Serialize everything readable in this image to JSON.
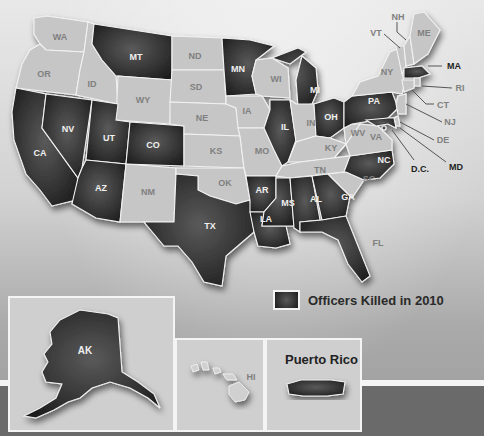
{
  "legend": {
    "label": "Officers Killed in 2010",
    "swatch_color": "#2a2a2a"
  },
  "colors": {
    "killed": "#2a2a2a",
    "not_killed": "#c6c6c6",
    "border": "#f2f2f2"
  },
  "states": {
    "WA": {
      "label": "WA",
      "killed": false
    },
    "OR": {
      "label": "OR",
      "killed": false
    },
    "CA": {
      "label": "CA",
      "killed": true
    },
    "ID": {
      "label": "ID",
      "killed": false
    },
    "NV": {
      "label": "NV",
      "killed": true
    },
    "MT": {
      "label": "MT",
      "killed": true
    },
    "WY": {
      "label": "WY",
      "killed": false
    },
    "UT": {
      "label": "UT",
      "killed": true
    },
    "AZ": {
      "label": "AZ",
      "killed": true
    },
    "CO": {
      "label": "CO",
      "killed": true
    },
    "NM": {
      "label": "NM",
      "killed": false
    },
    "ND": {
      "label": "ND",
      "killed": false
    },
    "SD": {
      "label": "SD",
      "killed": false
    },
    "NE": {
      "label": "NE",
      "killed": false
    },
    "KS": {
      "label": "KS",
      "killed": false
    },
    "OK": {
      "label": "OK",
      "killed": false
    },
    "TX": {
      "label": "TX",
      "killed": true
    },
    "MN": {
      "label": "MN",
      "killed": true
    },
    "IA": {
      "label": "IA",
      "killed": false
    },
    "MO": {
      "label": "MO",
      "killed": false
    },
    "AR": {
      "label": "AR",
      "killed": true
    },
    "LA": {
      "label": "LA",
      "killed": true
    },
    "WI": {
      "label": "WI",
      "killed": false
    },
    "IL": {
      "label": "IL",
      "killed": true
    },
    "MI": {
      "label": "MI",
      "killed": true
    },
    "IN": {
      "label": "IN",
      "killed": false
    },
    "OH": {
      "label": "OH",
      "killed": true
    },
    "KY": {
      "label": "KY",
      "killed": false
    },
    "TN": {
      "label": "TN",
      "killed": false
    },
    "MS": {
      "label": "MS",
      "killed": true
    },
    "AL": {
      "label": "AL",
      "killed": true
    },
    "GA": {
      "label": "GA",
      "killed": true
    },
    "FL": {
      "label": "FL",
      "killed": true
    },
    "SC": {
      "label": "SC",
      "killed": false
    },
    "NC": {
      "label": "NC",
      "killed": true
    },
    "VA": {
      "label": "VA",
      "killed": false
    },
    "WV": {
      "label": "WV",
      "killed": false
    },
    "PA": {
      "label": "PA",
      "killed": true
    },
    "NY": {
      "label": "NY",
      "killed": false
    },
    "VT": {
      "label": "VT",
      "killed": false
    },
    "NH": {
      "label": "NH",
      "killed": false
    },
    "ME": {
      "label": "ME",
      "killed": false
    },
    "MA": {
      "label": "MA",
      "killed": true
    },
    "RI": {
      "label": "RI",
      "killed": false
    },
    "CT": {
      "label": "CT",
      "killed": false
    },
    "NJ": {
      "label": "NJ",
      "killed": false
    },
    "DE": {
      "label": "DE",
      "killed": false
    },
    "MD": {
      "label": "MD",
      "killed": true
    },
    "DC": {
      "label": "D.C.",
      "killed": true
    },
    "AK": {
      "label": "AK",
      "killed": true
    },
    "HI": {
      "label": "HI",
      "killed": false
    },
    "PR": {
      "label": "Puerto Rico",
      "killed": true
    }
  },
  "insets": {
    "alaska": {
      "label": "AK"
    },
    "hawaii": {
      "label": "HI"
    },
    "puerto_rico": {
      "title": "Puerto Rico"
    }
  }
}
